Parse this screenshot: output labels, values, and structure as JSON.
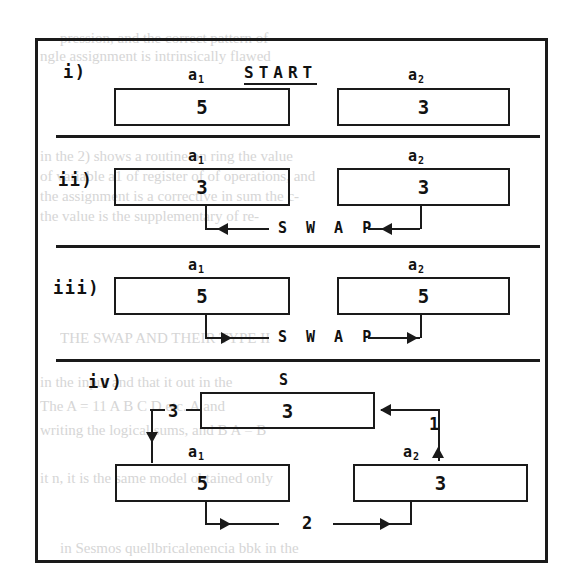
{
  "figure": {
    "kind": "swap-algorithm-diagram",
    "frame": {
      "border_color": "#1a1a1a"
    },
    "panels": [
      {
        "id": "i",
        "label": "i)",
        "caption": {
          "text": "START",
          "underlined": true
        },
        "boxes": [
          {
            "name": "a1",
            "label": "a",
            "subscript": "1",
            "value": "5"
          },
          {
            "name": "a2",
            "label": "a",
            "subscript": "2",
            "value": "3"
          }
        ],
        "connector_label": null
      },
      {
        "id": "ii",
        "label": "ii)",
        "caption": null,
        "boxes": [
          {
            "name": "a1",
            "label": "a",
            "subscript": "1",
            "value": "3"
          },
          {
            "name": "a2",
            "label": "a",
            "subscript": "2",
            "value": "3"
          }
        ],
        "connector_label": "S W A P",
        "connector_direction": "left"
      },
      {
        "id": "iii",
        "label": "iii)",
        "caption": null,
        "boxes": [
          {
            "name": "a1",
            "label": "a",
            "subscript": "1",
            "value": "5"
          },
          {
            "name": "a2",
            "label": "a",
            "subscript": "2",
            "value": "5"
          }
        ],
        "connector_label": "S W A P",
        "connector_direction": "right"
      },
      {
        "id": "iv",
        "label": "iv)",
        "caption": null,
        "boxes": [
          {
            "name": "S",
            "label": "S",
            "subscript": "",
            "value": "3"
          },
          {
            "name": "a1",
            "label": "a",
            "subscript": "1",
            "value": "5"
          },
          {
            "name": "a2",
            "label": "a",
            "subscript": "2",
            "value": "3"
          }
        ],
        "steps": [
          {
            "number": "1",
            "from": "a2",
            "to": "S"
          },
          {
            "number": "2",
            "from": "a1",
            "to": "a2"
          },
          {
            "number": "3",
            "from": "S",
            "to": "a1"
          }
        ]
      }
    ]
  }
}
